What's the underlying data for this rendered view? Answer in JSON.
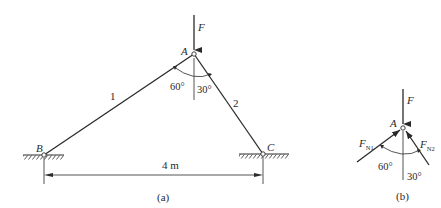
{
  "figure_a": {
    "caption": "(a)",
    "nodes": {
      "A": {
        "label": "A",
        "x": 194,
        "y": 54
      },
      "B": {
        "label": "B",
        "x": 44,
        "y": 155
      },
      "C": {
        "label": "C",
        "x": 263,
        "y": 154
      }
    },
    "members": [
      {
        "id": "1",
        "label": "1",
        "from": "B",
        "to": "A"
      },
      {
        "id": "2",
        "label": "2",
        "from": "A",
        "to": "C"
      }
    ],
    "load": {
      "label": "F",
      "direction": "down"
    },
    "angles": {
      "left": "60°",
      "right": "30°"
    },
    "dimension": {
      "label": "4 m"
    }
  },
  "figure_b": {
    "caption": "(b)",
    "node_label": "A",
    "load_label": "F",
    "force1": {
      "label": "F",
      "subscript": "N1"
    },
    "force2": {
      "label": "F",
      "subscript": "N2"
    },
    "angles": {
      "left": "60°",
      "right": "30°"
    }
  },
  "colors": {
    "line": "#2a2a2a",
    "background": "#ffffff"
  }
}
